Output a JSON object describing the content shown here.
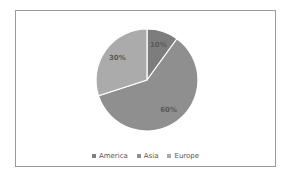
{
  "chart_data": {
    "type": "pie",
    "title": "",
    "categories": [
      "America",
      "Asia",
      "Europe"
    ],
    "values": [
      10,
      60,
      30
    ],
    "data_labels": [
      "10%",
      "60%",
      "30%"
    ],
    "colors": [
      "#7d7d7d",
      "#8f8f8f",
      "#ababab"
    ],
    "legend_position": "bottom",
    "start_angle": "12 o'clock, clockwise"
  },
  "legend": {
    "items": [
      {
        "label": "America",
        "color": "#7d7d7d"
      },
      {
        "label": "Asia",
        "color": "#8f8f8f"
      },
      {
        "label": "Europe",
        "color": "#ababab"
      }
    ]
  }
}
